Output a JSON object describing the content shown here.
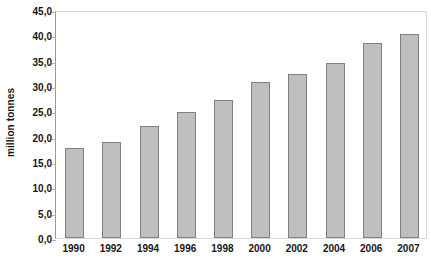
{
  "chart_data": {
    "type": "bar",
    "title": "",
    "subtitle": "",
    "xlabel": "",
    "ylabel": "million tonnes",
    "categories": [
      "1990",
      "1992",
      "1994",
      "1996",
      "1998",
      "2000",
      "2002",
      "2004",
      "2006",
      "2007"
    ],
    "values": [
      17.8,
      19.0,
      22.2,
      24.8,
      27.3,
      30.8,
      32.4,
      34.6,
      38.5,
      40.2
    ],
    "ylim": [
      0,
      45
    ],
    "ytick_values": [
      0,
      5,
      10,
      15,
      20,
      25,
      30,
      35,
      40,
      45
    ],
    "ytick_labels": [
      "0,0",
      "5,0",
      "10,0",
      "15,0",
      "20,0",
      "25,0",
      "30,0",
      "35,0",
      "40,0",
      "45,0"
    ],
    "grid": false,
    "legend": null,
    "legend_position": "none",
    "series": [
      {
        "name": "million tonnes",
        "values": [
          17.8,
          19.0,
          22.2,
          24.8,
          27.3,
          30.8,
          32.4,
          34.6,
          38.5,
          40.2
        ]
      }
    ],
    "annotations": [],
    "colors": {
      "bar_fill": "#bfbfbf",
      "bar_border": "#808080",
      "plot_border": "#d9d9d9",
      "axis_line": "#9a9a9a",
      "text": "#161616",
      "background": "#ffffff"
    }
  }
}
